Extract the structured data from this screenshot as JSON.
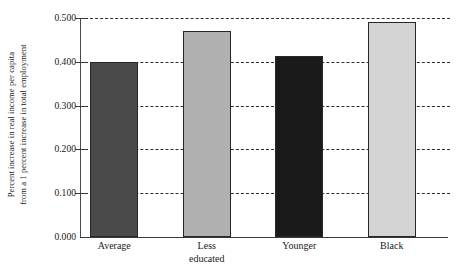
{
  "chart_data": {
    "type": "bar",
    "title": "",
    "subtitle": "",
    "xlabel": "",
    "ylabel_lines": [
      "Percent increase in real income per capita",
      "from a 1 percent increase in total employment"
    ],
    "categories": [
      "Average",
      "Less educated",
      "Younger",
      "Black"
    ],
    "category_lines": [
      [
        "Average"
      ],
      [
        "Less",
        "educated"
      ],
      [
        "Younger"
      ],
      [
        "Black"
      ]
    ],
    "values": [
      0.4,
      0.47,
      0.414,
      0.492
    ],
    "bar_colors": [
      "#4a4a4a",
      "#b0b0b0",
      "#1a1a1a",
      "#d4d4d4"
    ],
    "bar_edge_color": "#262626",
    "ylim": [
      0.0,
      0.5
    ],
    "yticks": [
      0.0,
      0.1,
      0.2,
      0.3,
      0.4,
      0.5
    ],
    "ytick_labels": [
      "0.000",
      "0.100",
      "0.200",
      "0.300",
      "0.400",
      "0.500"
    ],
    "grid": true,
    "grid_style": "dashed",
    "grid_color": "#2e2e2e",
    "legend": false,
    "legend_position": "none",
    "background": "#ffffff"
  }
}
